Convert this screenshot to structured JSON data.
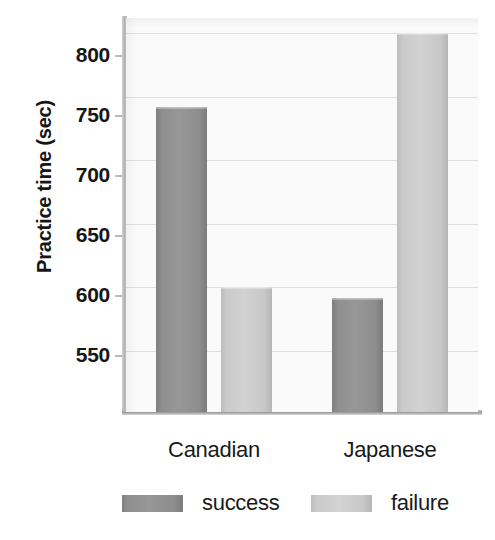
{
  "chart_data": {
    "type": "bar",
    "title": "",
    "subtitle": "",
    "xlabel": "",
    "ylabel": "Practice time (sec)",
    "categories": [
      "Canadian",
      "Japanese"
    ],
    "series": [
      {
        "name": "success",
        "values": [
          742,
          592
        ],
        "color": "#8e8e8e"
      },
      {
        "name": "failure",
        "values": [
          600,
          800
        ],
        "color": "#c9c9c9"
      }
    ],
    "yticks": [
      800,
      750,
      700,
      650,
      600,
      550
    ],
    "ylim": [
      502,
      812
    ],
    "grid": true,
    "legend_position": "bottom",
    "legend": [
      "success",
      "failure"
    ],
    "annotations": []
  },
  "axis": {
    "y_title": "Practice time (sec)",
    "tick_labels": [
      "800",
      "750",
      "700",
      "650",
      "600",
      "550"
    ],
    "category_labels": [
      "Canadian",
      "Japanese"
    ]
  },
  "legend": {
    "entries": [
      {
        "label": "success",
        "swatch": "success-swatch"
      },
      {
        "label": "failure",
        "swatch": "failure-swatch"
      }
    ]
  },
  "colors": {
    "success": "#8e8e8e",
    "failure": "#c9c9c9",
    "plot_background": "#fafafa",
    "gridline": "#dedede",
    "text": "#161616",
    "axis": "#a8a8a8"
  }
}
